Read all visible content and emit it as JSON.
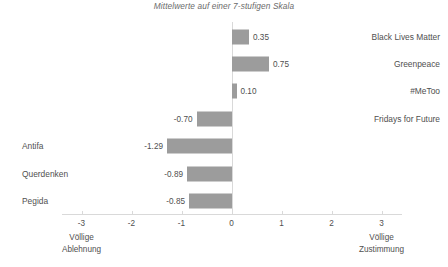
{
  "chart_data": {
    "type": "bar",
    "orientation": "horizontal",
    "title": "Mittelwerte auf einer 7-stufigen Skala",
    "subtitle": "",
    "xlabel": "",
    "ylabel": "",
    "xlim": [
      -3,
      3
    ],
    "grid": false,
    "legend": null,
    "bar_color": "#9c9c9c",
    "axis_color": "#d9d9d9",
    "text_color": "#4f4f4f",
    "categories": [
      "Black Lives Matter",
      "Greenpeace",
      "#MeToo",
      "Fridays for Future",
      "Antifa",
      "Querdenken",
      "Pegida"
    ],
    "values": [
      0.35,
      0.75,
      0.1,
      -0.7,
      -1.29,
      -0.89,
      -0.85
    ],
    "value_labels": [
      "0.35",
      "0.75",
      "0.10",
      "-0.70",
      "-1.29",
      "-0.89",
      "-0.85"
    ],
    "label_side": [
      "right",
      "right",
      "right",
      "right",
      "left",
      "left",
      "left"
    ],
    "ticks": [
      -3,
      -2,
      -1,
      0,
      1,
      2,
      3
    ],
    "tick_labels": [
      "-3",
      "-2",
      "-1",
      "0",
      "1",
      "2",
      "3"
    ],
    "axis_end_labels": {
      "left": {
        "line1": "Völlige",
        "line2": "Ablehnung",
        "at": -3
      },
      "right": {
        "line1": "Völlige",
        "line2": "Zustimmung",
        "at": 3
      }
    }
  },
  "watermark": {
    "text": ""
  }
}
